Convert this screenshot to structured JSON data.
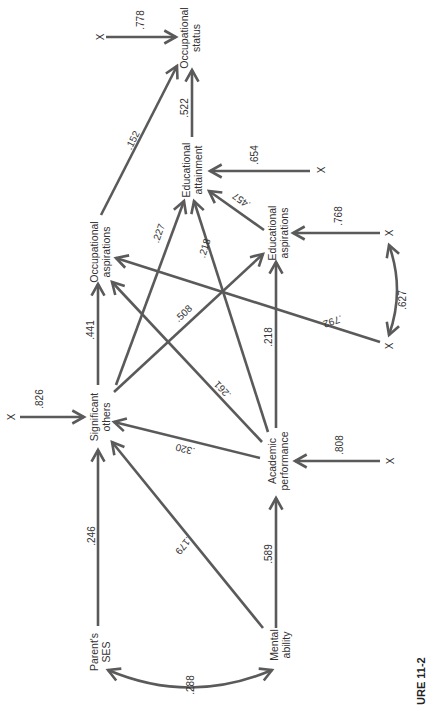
{
  "figure": {
    "caption": "URE 11-2",
    "orientation": "rotated 90 degrees counter-clockwise"
  },
  "nodes": {
    "parents_ses": {
      "line1": "Parent's",
      "line2": "SES"
    },
    "mental_ability": {
      "line1": "Mental",
      "line2": "ability"
    },
    "significant_others": {
      "line1": "Significant",
      "line2": "others"
    },
    "academic_performance": {
      "line1": "Academic",
      "line2": "performance"
    },
    "occupational_aspirations": {
      "line1": "Occupational",
      "line2": "aspirations"
    },
    "educational_aspirations": {
      "line1": "Educational",
      "line2": "aspirations"
    },
    "educational_attainment": {
      "line1": "Educational",
      "line2": "attainment"
    },
    "occupational_status": {
      "line1": "Occupational",
      "line2": "status"
    }
  },
  "error_terms": {
    "symbol": "X",
    "occupational_status": ".778",
    "educational_attainment": ".654",
    "educational_aspirations": ".768",
    "significant_others": ".826",
    "academic_performance": ".808",
    "occupational_aspirations": ".792",
    "aspirations_error_correlation": ".627"
  },
  "paths": {
    "ses_mental_correlation": ".288",
    "ses_to_significant_others": ".246",
    "mental_to_significant_others": ".179",
    "mental_to_academic": ".589",
    "academic_to_significant_others": ".320",
    "academic_to_occupational_aspirations": ".261",
    "academic_to_educational_aspirations": ".218",
    "academic_to_educational_attainment": ".218",
    "significant_to_occupational_aspirations": ".441",
    "significant_to_educational_aspirations": ".508",
    "significant_to_educational_attainment": ".227",
    "educational_aspirations_to_attainment": ".457",
    "occupational_aspirations_to_status": ".152",
    "educational_attainment_to_status": ".522"
  }
}
